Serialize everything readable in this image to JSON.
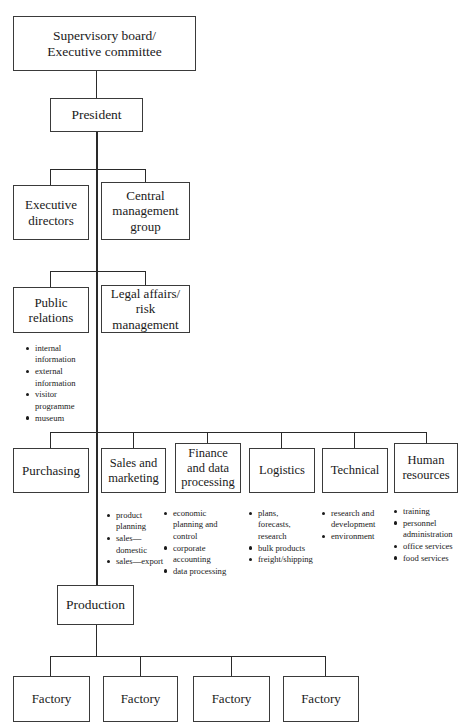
{
  "diagram": {
    "type": "org-chart",
    "line_color": "#2a2a2a",
    "box_border_color": "#3a3a3a",
    "background": "#ffffff",
    "text_color": "#1a1a1a"
  },
  "nodes": {
    "board": "Supervisory board/\nExecutive committee",
    "president": "President",
    "executive_directors": "Executive\ndirectors",
    "central_management_group": "Central\nmanagement\ngroup",
    "public_relations": "Public\nrelations",
    "legal_affairs": "Legal affairs/\nrisk\nmanagement",
    "purchasing": "Purchasing",
    "sales_marketing": "Sales and\nmarketing",
    "finance_data": "Finance\nand data\nprocessing",
    "logistics": "Logistics",
    "technical": "Technical",
    "human_resources": "Human\nresources",
    "production": "Production",
    "factory_1": "Factory",
    "factory_2": "Factory",
    "factory_3": "Factory",
    "factory_4": "Factory"
  },
  "bullets": {
    "public_relations": [
      "internal information",
      "external information",
      "visitor programme",
      "museum"
    ],
    "sales_marketing": [
      "product planning",
      "sales—domestic",
      "sales—export"
    ],
    "finance_data": [
      "economic planning and control",
      "corporate accounting",
      "data processing"
    ],
    "logistics": [
      "plans, forecasts, research",
      "bulk products",
      "freight/shipping"
    ],
    "technical": [
      "research and development",
      "environment"
    ],
    "human_resources": [
      "training",
      "personnel administration",
      "office services",
      "food services"
    ]
  }
}
